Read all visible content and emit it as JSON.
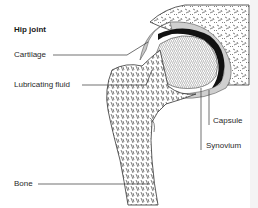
{
  "diagram": {
    "title": "Hip joint",
    "labels": {
      "cartilage": "Cartilage",
      "lubricating_fluid": "Lubricating fluid",
      "capsule": "Capsule",
      "synovium": "Synovium",
      "bone": "Bone"
    },
    "colors": {
      "line": "#333333",
      "cartilage_band": "#111111",
      "capsule_fill": "#c8c8c8",
      "bone_texture": "#555555",
      "background": "#ffffff"
    }
  }
}
